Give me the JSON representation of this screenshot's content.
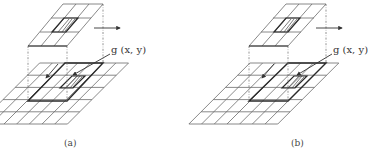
{
  "figure": {
    "panels": [
      {
        "id": "a",
        "caption": "(a)",
        "pixel_label": "g (x, y)",
        "kernel_grid": {
          "rows": 3,
          "cols": 3,
          "hatched_cell": [
            1,
            1
          ]
        },
        "image_grid": {
          "rows": 5,
          "cols": 7,
          "window_origin_col": 2,
          "window_origin_row": 0
        }
      },
      {
        "id": "b",
        "caption": "(b)",
        "pixel_label": "g (x, y)",
        "kernel_grid": {
          "rows": 3,
          "cols": 3,
          "hatched_cell": [
            1,
            1
          ]
        },
        "image_grid": {
          "rows": 5,
          "cols": 7,
          "window_origin_col": 3,
          "window_origin_row": 0
        }
      }
    ],
    "colors": {
      "line": "#6b6b6b",
      "thick": "#2a2a2a",
      "background": "#ffffff"
    }
  }
}
